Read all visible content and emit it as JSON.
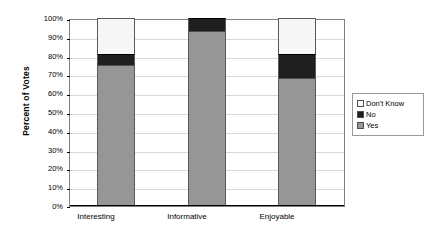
{
  "chart_data": {
    "type": "bar",
    "subtype": "stacked-bar-100-percent",
    "title": "",
    "xlabel": "",
    "ylabel": "Percent of Votes",
    "ylim": [
      0,
      100
    ],
    "ytick_labels": [
      "100%",
      "90%",
      "80%",
      "70%",
      "60%",
      "50%",
      "40%",
      "30%",
      "20%",
      "10%",
      "0%"
    ],
    "ytick_values": [
      100,
      90,
      80,
      70,
      60,
      50,
      40,
      30,
      20,
      10,
      0
    ],
    "categories": [
      "Interesting",
      "Informative",
      "Enjoyable"
    ],
    "series": [
      {
        "name": "Yes",
        "values": [
          75,
          93,
          68
        ],
        "color": "#969696"
      },
      {
        "name": "No",
        "values": [
          6,
          7,
          13
        ],
        "color": "#1f1f1f"
      },
      {
        "name": "Don't Know",
        "values": [
          19,
          0,
          19
        ],
        "color": "#f7f7f7"
      }
    ],
    "grid": true,
    "grid_axis": "y",
    "legend_position": "right",
    "legend_order": [
      "Don't Know",
      "No",
      "Yes"
    ],
    "plot_border": true
  },
  "axis": {
    "y_title": "Percent of Votes",
    "ticks": [
      {
        "label": "100%",
        "value": 100
      },
      {
        "label": "90%",
        "value": 90
      },
      {
        "label": "80%",
        "value": 80
      },
      {
        "label": "70%",
        "value": 70
      },
      {
        "label": "60%",
        "value": 60
      },
      {
        "label": "50%",
        "value": 50
      },
      {
        "label": "40%",
        "value": 40
      },
      {
        "label": "30%",
        "value": 30
      },
      {
        "label": "20%",
        "value": 20
      },
      {
        "label": "10%",
        "value": 10
      },
      {
        "label": "0%",
        "value": 0
      }
    ],
    "categories": [
      {
        "label": "Interesting"
      },
      {
        "label": "Informative"
      },
      {
        "label": "Enjoyable"
      }
    ]
  },
  "legend": {
    "entries": [
      {
        "label": "Don't Know",
        "color": "#f7f7f7"
      },
      {
        "label": "No",
        "color": "#1f1f1f"
      },
      {
        "label": "Yes",
        "color": "#969696"
      }
    ]
  }
}
